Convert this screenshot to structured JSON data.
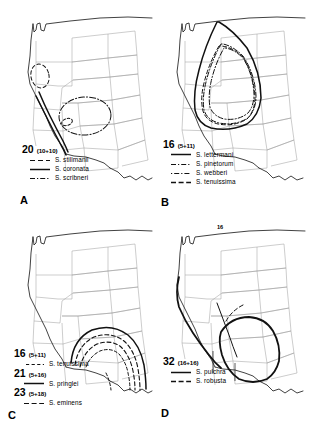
{
  "figure": {
    "kind": "distribution-maps",
    "background": "#ffffff",
    "line_color": "#000000",
    "border_color": "#9a9a9a",
    "region": "western-united-states"
  },
  "panels": [
    {
      "letter": "A",
      "count": "20",
      "paren": "(10+10)",
      "species": [
        {
          "name": "S. stillmanii",
          "style": "dashed"
        },
        {
          "name": "S. coronata",
          "style": "solid"
        },
        {
          "name": "S. scribneri",
          "style": "dashdot"
        }
      ],
      "annotation": ""
    },
    {
      "letter": "B",
      "count": "16",
      "paren": "(5+11)",
      "species": [
        {
          "name": "S. lettermani",
          "style": "solid"
        },
        {
          "name": "S. pinetorum",
          "style": "dashdot"
        },
        {
          "name": "S. webberi",
          "style": "dotdash"
        },
        {
          "name": "S. tenuissima",
          "style": "dashed"
        }
      ],
      "annotation": ""
    },
    {
      "letter": "C",
      "count": "",
      "paren": "",
      "groups": [
        {
          "count": "16",
          "paren": "(5+11)",
          "name": "S. tenuissima",
          "style": "dashed"
        },
        {
          "count": "21",
          "paren": "(5+16)",
          "name": "S. pringlei",
          "style": "solid"
        },
        {
          "count": "23",
          "paren": "(5+18)",
          "name": "S. eminens",
          "style": "dashed"
        }
      ],
      "annotation": ""
    },
    {
      "letter": "D",
      "count": "32",
      "paren": "(16+16)",
      "species": [
        {
          "name": "S. pulchra",
          "style": "solid"
        },
        {
          "name": "S. robusta",
          "style": "dashed"
        }
      ],
      "annotation": "16"
    }
  ]
}
